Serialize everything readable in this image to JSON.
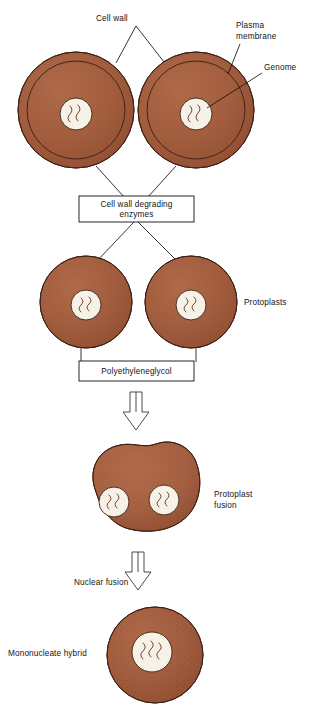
{
  "figure": {
    "title": "Protoplast fusion",
    "type": "biological-process-flow-diagram",
    "background_color": "#ffffff"
  },
  "colors": {
    "cell_fill": "#a05a3c",
    "cell_fill_light": "#ab6646",
    "cell_outline": "#3d2116",
    "nucleus_fill": "#f7f2e8",
    "genome_stroke": "#6b3a26",
    "text": "#141414",
    "box_border": "#111111",
    "arrow_stroke": "#3a3330"
  },
  "labels": {
    "cell_wall": "Cell wall",
    "plasma_membrane_line1": "Plasma",
    "plasma_membrane_line2": "membrane",
    "genome": "Genome",
    "protoplasts": "Protoplasts",
    "protoplast_fusion_line1": "Protoplast",
    "protoplast_fusion_line2": "fusion",
    "nuclear_fusion": "Nuclear fusion",
    "mononucleate_hybrid": "Mononucleate hybrid"
  },
  "process_boxes": [
    {
      "id": "enzymes",
      "line1": "Cell wall degrading",
      "line2": "enzymes"
    },
    {
      "id": "peg",
      "line1": "Polyethyleneglycol",
      "line2": ""
    }
  ],
  "stages": [
    {
      "id": "stage-intact-cells",
      "name": "Intact walled cells",
      "count": 2,
      "has_cell_wall": true,
      "nuclei_per_cell": 1
    },
    {
      "id": "stage-protoplasts",
      "name": "Protoplasts",
      "count": 2,
      "has_cell_wall": false,
      "nuclei_per_cell": 1
    },
    {
      "id": "stage-fusion-product",
      "name": "Protoplast fusion",
      "count": 1,
      "has_cell_wall": false,
      "nuclei_per_cell": 2
    },
    {
      "id": "stage-hybrid",
      "name": "Mononucleate hybrid",
      "count": 1,
      "has_cell_wall": false,
      "nuclei_per_cell": 1
    }
  ],
  "arrows": [
    {
      "id": "arrow-peg-to-fusion",
      "direction": "down"
    },
    {
      "id": "arrow-fusion-to-hybrid",
      "direction": "down"
    }
  ]
}
